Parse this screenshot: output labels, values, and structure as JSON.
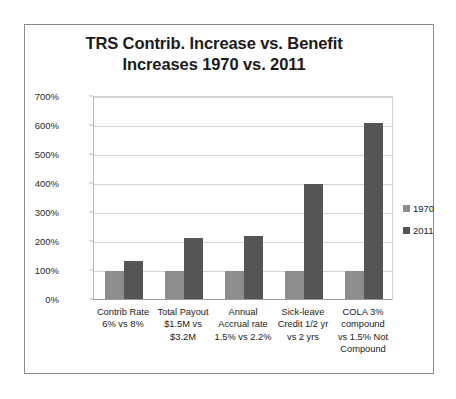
{
  "chart_data": {
    "type": "bar",
    "title": "TRS Contrib. Increase vs. Benefit Increases 1970 vs. 2011",
    "title_lines": [
      "TRS Contrib. Increase vs. Benefit",
      "Increases 1970 vs. 2011"
    ],
    "xlabel": "",
    "ylabel": "",
    "ylim": [
      0,
      700
    ],
    "ytick_labels": [
      "700%",
      "600%",
      "500%",
      "400%",
      "300%",
      "200%",
      "100%",
      "0%"
    ],
    "ytick_values": [
      700,
      600,
      500,
      400,
      300,
      200,
      100,
      0
    ],
    "grid": "horizontal",
    "legend_position": "right",
    "categories": [
      "Contrib Rate 6% vs 8%",
      "Total Payout $1.5M vs $3.2M",
      "Annual Accrual rate 1.5% vs 2.2%",
      "Sick-leave Credit 1/2 yr vs 2 yrs",
      "COLA 3% compound vs 1.5% Not Compound"
    ],
    "category_lines": [
      [
        "Contrib Rate",
        "6% vs 8%"
      ],
      [
        "Total Payout",
        "$1.5M vs",
        "$3.2M"
      ],
      [
        "Annual",
        "Accrual rate",
        "1.5% vs 2.2%"
      ],
      [
        "Sick-leave",
        "Credit 1/2 yr",
        "vs 2 yrs"
      ],
      [
        "COLA 3%",
        "compound",
        "vs 1.5% Not",
        "Compound"
      ]
    ],
    "series": [
      {
        "name": "1970",
        "color": "#8d8d8d",
        "values": [
          100,
          100,
          100,
          100,
          100
        ]
      },
      {
        "name": "2011",
        "color": "#555555",
        "values": [
          133,
          213,
          220,
          400,
          612
        ]
      }
    ]
  },
  "legend": {
    "items": [
      {
        "label": "1970",
        "color": "#8d8d8d"
      },
      {
        "label": "2011",
        "color": "#555555"
      }
    ]
  },
  "colors": {
    "series_1970": "#8d8d8d",
    "series_2011": "#555555",
    "gridline": "#d3d3d3",
    "frame_border": "#8a8a8a",
    "text": "#1a1a1a",
    "background": "#ffffff"
  }
}
